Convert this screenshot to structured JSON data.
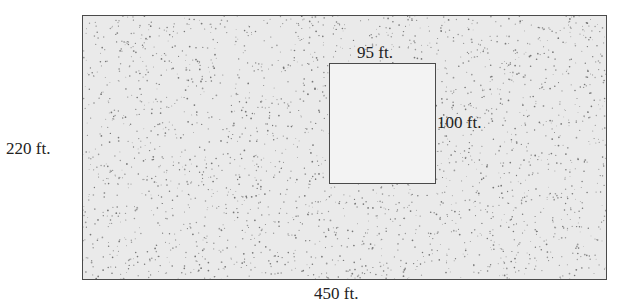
{
  "diagram": {
    "outer_rectangle": {
      "width_label": "450 ft.",
      "height_label": "220 ft.",
      "fill": "stippled gray"
    },
    "inner_rectangle": {
      "width_label": "95 ft.",
      "height_label": "100 ft.",
      "fill": "light gray (unstippled)"
    },
    "colors": {
      "border": "#4a4a4a",
      "outer_fill": "#eaeaea",
      "inner_fill": "#f3f3f3",
      "text": "#222222"
    }
  }
}
